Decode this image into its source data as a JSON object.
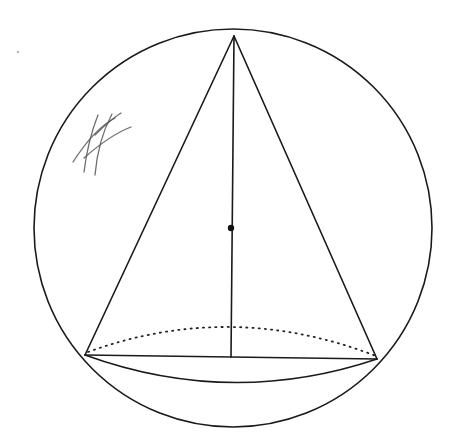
{
  "diagram": {
    "description": "Cone inscribed in a sphere: sphere outline circle, cone apex at top of sphere, elliptical base with dotted back half, vertical axis with center point marked, and a hand-drawn hatch mark on the upper left.",
    "colors": {
      "background": "#ffffff",
      "line": "#1a1a1a",
      "scribble": "#555555"
    },
    "sphere": {
      "cx": 233,
      "cy": 228,
      "r": 199
    },
    "cone": {
      "apex": {
        "x": 234,
        "y": 36
      },
      "base_left": {
        "x": 85,
        "y": 355
      },
      "base_right": {
        "x": 377,
        "y": 359
      },
      "base_center": {
        "x": 231,
        "y": 357
      }
    },
    "center_point": {
      "x": 231,
      "y": 228
    },
    "labels": []
  }
}
